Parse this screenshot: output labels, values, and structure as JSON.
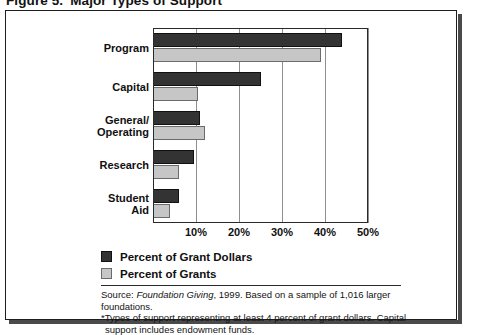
{
  "figure": {
    "label": "Figure 5.",
    "title": "Major Types of Support"
  },
  "legend": {
    "position": "below-plot",
    "items": [
      {
        "label": "Percent of Grant Dollars",
        "color": "#333333",
        "key": "dollars"
      },
      {
        "label": "Percent of Grants",
        "color": "#c6c6c6",
        "key": "grants"
      }
    ]
  },
  "source": {
    "line1_prefix": "Source: ",
    "line1_italic": "Foundation Giving",
    "line1_suffix": ", 1999. Based on a sample of 1,016 larger foundations.",
    "line2": "*Types of support representing at least 4 percent of grant dollars. Capital",
    "line3": "support includes endowment funds."
  },
  "chart_data": {
    "type": "bar",
    "orientation": "horizontal",
    "title": "Major Types of Support",
    "xlabel": "",
    "ylabel": "",
    "xlim": [
      0,
      50
    ],
    "xticks": [
      10,
      20,
      30,
      40,
      50
    ],
    "xtick_labels": [
      "10%",
      "20%",
      "30%",
      "40%",
      "50%"
    ],
    "grid": true,
    "grid_axis": "x",
    "categories": [
      "Program",
      "Capital",
      "General/Operating",
      "Research",
      "Student Aid"
    ],
    "category_lines": [
      [
        "Program"
      ],
      [
        "Capital"
      ],
      [
        "General/",
        "Operating"
      ],
      [
        "Research"
      ],
      [
        "Student",
        "Aid"
      ]
    ],
    "series": [
      {
        "name": "Percent of Grant Dollars",
        "color": "#333333",
        "values": [
          44,
          25,
          11,
          9.5,
          6
        ]
      },
      {
        "name": "Percent of Grants",
        "color": "#c6c6c6",
        "values": [
          39,
          10.5,
          12,
          6,
          4
        ]
      }
    ]
  }
}
